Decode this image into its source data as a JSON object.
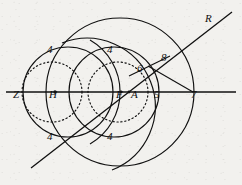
{
  "figure": {
    "kind": "geometric-construction",
    "background_color": "#f2f1ee",
    "ink_color": "#101010",
    "caption": "",
    "labels": [
      {
        "id": "label-Z",
        "text": "Z",
        "x": 13,
        "y": 94,
        "role": "line-endpoint-left",
        "style": "italic"
      },
      {
        "id": "label-H",
        "text": "H",
        "x": 49,
        "y": 94,
        "role": "point-center-small",
        "style": "italic"
      },
      {
        "id": "label-F",
        "text": "F",
        "x": 116,
        "y": 94,
        "role": "point-focus",
        "style": "italic"
      },
      {
        "id": "label-A",
        "text": "A",
        "x": 131,
        "y": 94,
        "role": "point-vertex",
        "style": "italic"
      },
      {
        "id": "label-R",
        "text": "R",
        "x": 205,
        "y": 13,
        "role": "line-endpoint-right",
        "style": "italic"
      },
      {
        "id": "label-5",
        "text": "5",
        "x": 154,
        "y": 94,
        "role": "measure",
        "style": "italic"
      },
      {
        "id": "label-6",
        "text": "6",
        "x": 137,
        "y": 63,
        "role": "measure",
        "style": "italic"
      },
      {
        "id": "label-7",
        "text": "7",
        "x": 191,
        "y": 94,
        "role": "measure",
        "style": "italic"
      },
      {
        "id": "label-8",
        "text": "8",
        "x": 161,
        "y": 52,
        "role": "measure",
        "style": "italic"
      },
      {
        "id": "label-4-upper-left",
        "text": "4",
        "x": 47,
        "y": 48,
        "role": "arc-intersection",
        "style": "italic"
      },
      {
        "id": "label-4-upper-right",
        "text": "4",
        "x": 107,
        "y": 48,
        "role": "arc-intersection",
        "style": "italic"
      },
      {
        "id": "label-4-lower-left",
        "text": "4",
        "x": 47,
        "y": 135,
        "role": "arc-intersection",
        "style": "italic"
      },
      {
        "id": "label-4-lower-right",
        "text": "4",
        "x": 107,
        "y": 135,
        "role": "arc-intersection",
        "style": "italic"
      }
    ],
    "points": [
      {
        "id": "point-H",
        "x": 55,
        "y": 92
      },
      {
        "id": "point-F",
        "x": 121,
        "y": 92
      },
      {
        "id": "point-A",
        "x": 129,
        "y": 92
      }
    ],
    "lines": [
      {
        "id": "horizontal-axis",
        "x1": 6,
        "y1": 92,
        "x2": 236,
        "y2": 92,
        "style": "solid"
      },
      {
        "id": "diagonal-line-ZR",
        "x1": 31,
        "y1": 168,
        "x2": 232,
        "y2": 12,
        "style": "solid"
      },
      {
        "id": "radius-segment-8-to-7",
        "x1": 146,
        "y1": 67,
        "x2": 193,
        "y2": 92,
        "style": "solid"
      },
      {
        "id": "radius-segment-6-to-8",
        "x1": 131,
        "y1": 74,
        "x2": 168,
        "y2": 57,
        "style": "solid"
      }
    ],
    "circles": [
      {
        "id": "circle-large-outer",
        "cx": 120,
        "cy": 92,
        "r": 74,
        "style": "solid"
      },
      {
        "id": "circle-medium-left",
        "cx": 68,
        "cy": 92,
        "r": 45,
        "style": "solid"
      },
      {
        "id": "circle-medium-right",
        "cx": 114,
        "cy": 92,
        "r": 45,
        "style": "solid"
      },
      {
        "id": "circle-dotted-left",
        "cx": 52,
        "cy": 92,
        "r": 30,
        "style": "dotted"
      },
      {
        "id": "circle-dotted-right",
        "cx": 118,
        "cy": 92,
        "r": 30,
        "style": "dotted"
      }
    ],
    "arcs": [
      {
        "id": "arc-upper-left",
        "cx": 120,
        "cy": 92,
        "r": 60,
        "style": "solid"
      },
      {
        "id": "arc-upper-right",
        "cx": 55,
        "cy": 92,
        "r": 60,
        "style": "solid"
      }
    ]
  }
}
